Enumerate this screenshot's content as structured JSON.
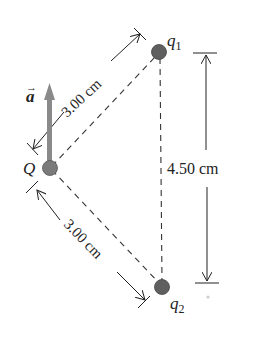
{
  "diagram": {
    "charges": [
      {
        "id": "q1",
        "label": "q",
        "sub": "1",
        "x": 159,
        "y": 52
      },
      {
        "id": "Q",
        "label": "Q",
        "x": 50,
        "y": 168
      },
      {
        "id": "q2",
        "label": "q",
        "sub": "2",
        "x": 162,
        "y": 287
      }
    ],
    "acceleration": {
      "label": "a",
      "vector_mark": "→",
      "color": "#8a8a8a"
    },
    "dimensions": {
      "upper": "3.00 cm",
      "lower": "3.00 cm",
      "vertical": "4.50 cm"
    },
    "colors": {
      "charge_fill": "#5f5f5f",
      "line": "#222222",
      "arrow_gray": "#8a8a8a"
    }
  }
}
